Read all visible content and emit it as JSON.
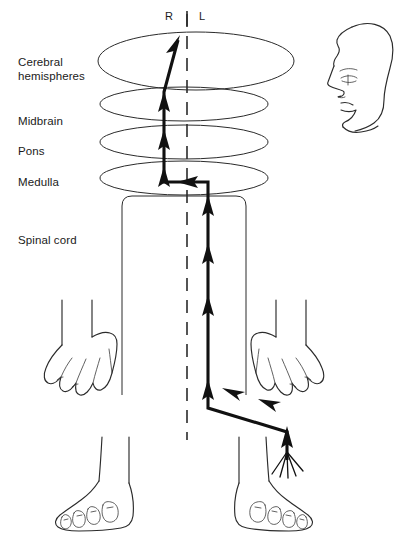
{
  "figure": {
    "background_color": "#ffffff",
    "ink_color": "#2b2b2b",
    "tract_color": "#111111"
  },
  "orientation": {
    "right_label": "R",
    "left_label": "L",
    "divider": "midline-tick"
  },
  "labels": {
    "cerebral_line1": "Cerebral",
    "cerebral_line2": "hemispheres",
    "midbrain": "Midbrain",
    "pons": "Pons",
    "medulla": "Medulla",
    "spinal_cord": "Spinal cord"
  },
  "structures": [
    {
      "name": "cerebral-hemispheres",
      "shape": "ellipse",
      "cx": 196,
      "cy": 61,
      "rx": 98,
      "ry": 29
    },
    {
      "name": "midbrain",
      "shape": "ellipse",
      "cx": 184,
      "cy": 104,
      "rx": 84,
      "ry": 17
    },
    {
      "name": "pons",
      "shape": "ellipse",
      "cx": 184,
      "cy": 142,
      "rx": 84,
      "ry": 17
    },
    {
      "name": "medulla",
      "shape": "ellipse",
      "cx": 184,
      "cy": 178,
      "rx": 84,
      "ry": 17
    },
    {
      "name": "spinal-cord",
      "shape": "rounded-column",
      "x": 122,
      "y": 196,
      "width": 124,
      "height": 199
    }
  ],
  "midline": {
    "name": "body-midline",
    "x": 187,
    "y_top": 14,
    "y_bottom": 440,
    "dash": "13 9"
  },
  "pathway": {
    "description": "Sensory tract: right foot -> up leg -> crosses to right side of cord -> ascends spinal cord -> decussates in medulla -> ascends left brainstem -> left cerebral hemisphere",
    "entry_point": "right-foot",
    "decussation_level": "medulla",
    "terminus": "cerebral-hemispheres",
    "arrow_count": 11,
    "segments": [
      {
        "name": "foot-entry",
        "from": [
          287,
          462
        ],
        "to": [
          287,
          432
        ],
        "direction": "up"
      },
      {
        "name": "leg-to-cord-diagonal",
        "from": [
          287,
          432
        ],
        "to": [
          208,
          408
        ],
        "direction": "left"
      },
      {
        "name": "cord-ascent",
        "from": [
          208,
          408
        ],
        "to": [
          208,
          186
        ],
        "direction": "up"
      },
      {
        "name": "medulla-decussation",
        "from": [
          208,
          181
        ],
        "to": [
          163,
          181
        ],
        "direction": "left"
      },
      {
        "name": "brainstem-ascent",
        "from": [
          163,
          181
        ],
        "to": [
          163,
          92
        ],
        "direction": "up"
      },
      {
        "name": "cortical-projection",
        "from": [
          163,
          92
        ],
        "to": [
          178,
          38
        ],
        "direction": "up-right"
      }
    ]
  },
  "limbs": {
    "left_hand": {
      "name": "left-hand",
      "has_pathway": false
    },
    "right_hand": {
      "name": "right-hand",
      "has_pathway": false
    },
    "left_foot": {
      "name": "left-foot",
      "has_pathway": false
    },
    "right_foot": {
      "name": "right-foot",
      "has_pathway": true,
      "fan_rays": 5
    }
  },
  "head": {
    "name": "head-profile",
    "facing": "left",
    "features": [
      "forehead",
      "eyebrow",
      "eye",
      "nose",
      "lips",
      "chin",
      "jaw"
    ]
  }
}
